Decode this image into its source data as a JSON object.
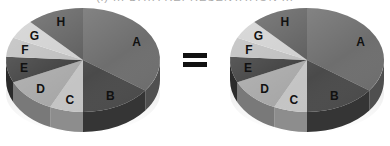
{
  "caption": "(i) ... DATA REPRESENTATION ...",
  "equals_symbol": "=",
  "chart_data": [
    {
      "type": "pie",
      "style": "3d",
      "title": "",
      "labels": [
        "A",
        "B",
        "C",
        "D",
        "E",
        "F",
        "G",
        "H"
      ],
      "values": [
        35,
        15,
        7,
        11,
        8,
        6,
        6,
        12
      ],
      "colors": [
        "#6e6e6e",
        "#4a4a4a",
        "#c4c4c4",
        "#a8a8a8",
        "#3c3c3c",
        "#bdbdbd",
        "#cfcfcf",
        "#5a5a5a"
      ],
      "start_angle_deg": 0,
      "direction": "clockwise"
    },
    {
      "type": "pie",
      "style": "3d",
      "title": "",
      "labels": [
        "A",
        "B",
        "C",
        "D",
        "E",
        "F",
        "G",
        "H"
      ],
      "values": [
        35,
        15,
        7,
        11,
        8,
        6,
        6,
        12
      ],
      "colors": [
        "#6e6e6e",
        "#4a4a4a",
        "#c4c4c4",
        "#a8a8a8",
        "#3c3c3c",
        "#bdbdbd",
        "#cfcfcf",
        "#5a5a5a"
      ],
      "start_angle_deg": 0,
      "direction": "clockwise"
    }
  ]
}
